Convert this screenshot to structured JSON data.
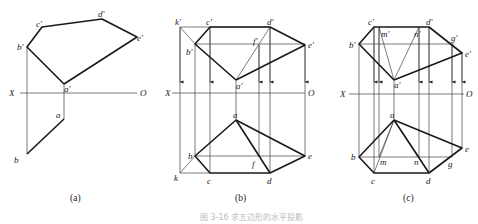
{
  "panels": [
    {
      "caption": "(a)",
      "axis": {
        "left": "X",
        "right": "O"
      },
      "labels": {
        "a_prime": "a'",
        "b_prime": "b'",
        "c_prime": "c'",
        "d_prime": "d'",
        "e_prime": "e'",
        "a": "a",
        "b": "b"
      }
    },
    {
      "caption": "(b)",
      "axis": {
        "left": "X",
        "right": "O"
      },
      "labels": {
        "k_prime": "k'",
        "c_prime": "c'",
        "d_prime": "d'",
        "f_prime": "f'",
        "b_prime": "b'",
        "e_prime": "e'",
        "a_prime": "a'",
        "a": "a",
        "b": "b",
        "f": "f",
        "e": "e",
        "k": "k",
        "c": "c",
        "d": "d"
      }
    },
    {
      "caption": "(c)",
      "axis": {
        "left": "X",
        "right": "O"
      },
      "labels": {
        "c_prime": "c'",
        "m_prime": "m'",
        "n_prime": "n'",
        "d_prime": "d'",
        "g_prime": "g'",
        "b_prime": "b'",
        "e_prime": "e'",
        "a_prime": "a'",
        "a": "a",
        "b": "b",
        "m": "m",
        "n": "n",
        "g": "g",
        "e": "e",
        "c": "c",
        "d": "d"
      }
    }
  ],
  "figure_caption": "图 3-16   求五边形的水平投影"
}
